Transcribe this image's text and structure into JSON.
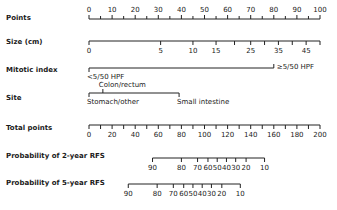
{
  "chart_data": {
    "type": "nomogram",
    "title": "",
    "axis_pixel_range": {
      "zero_x": 89,
      "max_x": 320,
      "points_max": 100
    },
    "rows": [
      {
        "label": "Points",
        "kind": "scale",
        "min": 0,
        "max": 100,
        "ticks": [
          0,
          5,
          10,
          15,
          20,
          25,
          30,
          35,
          40,
          45,
          50,
          55,
          60,
          65,
          70,
          75,
          80,
          85,
          90,
          95,
          100
        ],
        "labels": [
          0,
          10,
          20,
          30,
          40,
          50,
          60,
          70,
          80,
          90,
          100
        ],
        "label_position": "above"
      },
      {
        "label": "Size (cm)",
        "kind": "variable",
        "label_position": "below",
        "values": [
          {
            "value": "0",
            "points": 0
          },
          {
            "value": "5",
            "points": 31
          },
          {
            "value": "10",
            "points": 45
          },
          {
            "value": "15",
            "points": 55
          },
          {
            "value": "20",
            "points": 63
          },
          {
            "value": "25",
            "points": 70
          },
          {
            "value": "30",
            "points": 76
          },
          {
            "value": "35",
            "points": 82
          },
          {
            "value": "40",
            "points": 88
          },
          {
            "value": "45",
            "points": 94
          },
          {
            "value": "50",
            "points": 100
          }
        ],
        "visible_labels": [
          "0",
          "5",
          "10",
          "15",
          "25",
          "35",
          "45"
        ]
      },
      {
        "label": "Mitotic index",
        "kind": "categorical",
        "values": [
          {
            "value": "<5/50 HPF",
            "points": 0,
            "label_position": "below"
          },
          {
            "value": "≥5/50 HPF",
            "points": 80,
            "label_position": "right"
          }
        ]
      },
      {
        "label": "Site",
        "kind": "categorical",
        "values": [
          {
            "value": "Stomach/other",
            "points": 0,
            "label_position": "below"
          },
          {
            "value": "Colon/rectum",
            "points": 6,
            "label_position": "above"
          },
          {
            "value": "Small intestine",
            "points": 39,
            "label_position": "below"
          }
        ]
      },
      {
        "label": "Total points",
        "kind": "scale",
        "min": 0,
        "max": 200,
        "ticks": [
          0,
          10,
          20,
          30,
          40,
          50,
          60,
          70,
          80,
          90,
          100,
          110,
          120,
          130,
          140,
          150,
          160,
          170,
          180,
          190,
          200
        ],
        "labels": [
          0,
          20,
          40,
          60,
          80,
          100,
          120,
          140,
          160,
          180,
          200
        ],
        "label_position": "below"
      },
      {
        "label": "Probability of 2-year RFS",
        "kind": "probability",
        "label_position": "below",
        "values": [
          {
            "value": "90",
            "total_points": 55
          },
          {
            "value": "80",
            "total_points": 80
          },
          {
            "value": "70",
            "total_points": 94
          },
          {
            "value": "60",
            "total_points": 103
          },
          {
            "value": "50",
            "total_points": 111
          },
          {
            "value": "40",
            "total_points": 119
          },
          {
            "value": "30",
            "total_points": 127
          },
          {
            "value": "20",
            "total_points": 136
          },
          {
            "value": "10",
            "total_points": 152
          }
        ]
      },
      {
        "label": "Probability of 5-year RFS",
        "kind": "probability",
        "label_position": "below",
        "values": [
          {
            "value": "90",
            "total_points": 34
          },
          {
            "value": "80",
            "total_points": 59
          },
          {
            "value": "70",
            "total_points": 73
          },
          {
            "value": "60",
            "total_points": 82
          },
          {
            "value": "50",
            "total_points": 90
          },
          {
            "value": "40",
            "total_points": 98
          },
          {
            "value": "30",
            "total_points": 106
          },
          {
            "value": "20",
            "total_points": 115
          },
          {
            "value": "10",
            "total_points": 131
          }
        ]
      }
    ]
  }
}
